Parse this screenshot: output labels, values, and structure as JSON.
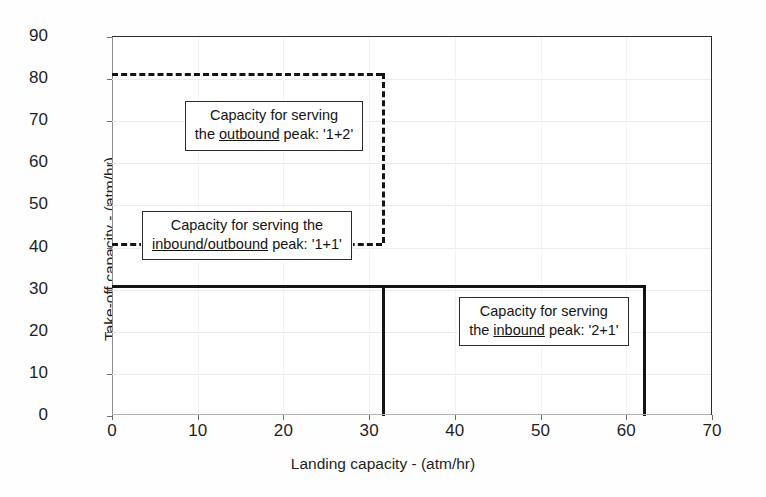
{
  "chart_data": {
    "type": "line",
    "title": "",
    "xlabel": "Landing capacity  -  (atm/hr)",
    "ylabel": "Take-off capacity  -  (atm/hr)",
    "xlim": [
      0,
      70
    ],
    "ylim": [
      0,
      90
    ],
    "xticks": [
      0,
      10,
      20,
      30,
      40,
      50,
      60,
      70
    ],
    "yticks": [
      0,
      10,
      20,
      30,
      40,
      50,
      60,
      70,
      80,
      90
    ],
    "grid": true,
    "legend": "none",
    "units": "atm/hr",
    "series": [
      {
        "name": "Capacity envelope for the outbound peak: '1+2'",
        "style": "dashed",
        "color": "#141414",
        "points": [
          [
            0,
            81.5
          ],
          [
            31.5,
            81.5
          ],
          [
            31.5,
            41.0
          ]
        ]
      },
      {
        "name": "Capacity envelope for the inbound/outbound peak: '1+1'",
        "style": "dashed",
        "color": "#141414",
        "points": [
          [
            0,
            41.0
          ],
          [
            31.5,
            41.0
          ]
        ]
      },
      {
        "name": "Capacity envelope for the inbound peak: '2+1'",
        "style": "solid",
        "color": "#141414",
        "points": [
          [
            0,
            31.0
          ],
          [
            62.0,
            31.0
          ],
          [
            62.0,
            0
          ]
        ]
      },
      {
        "name": "Vertical boundary at landing capacity 31.5",
        "style": "solid",
        "color": "#141414",
        "points": [
          [
            31.5,
            31.0
          ],
          [
            31.5,
            0
          ]
        ]
      }
    ],
    "annotations": [
      {
        "id": "outbound",
        "line1": "Capacity for serving",
        "line2_pre": "the ",
        "line2_underline": "outbound",
        "line2_post": " peak: '1+2'",
        "x": 8.5,
        "y": 74.5
      },
      {
        "id": "inbound-outbound",
        "line1": "Capacity for serving the",
        "line2_pre": "",
        "line2_underline": "inbound/outbound",
        "line2_post": " peak: '1+1'",
        "x": 3.5,
        "y": 48.5
      },
      {
        "id": "inbound",
        "line1": "Capacity for serving",
        "line2_pre": "the ",
        "line2_underline": "inbound",
        "line2_post": " peak: '2+1'",
        "x": 40.5,
        "y": 28.0
      }
    ]
  },
  "axes": {
    "x_title": "Landing capacity  -  (atm/hr)",
    "y_title": "Take-off capacity  -  (atm/hr)",
    "x_tick_labels": [
      "0",
      "10",
      "20",
      "30",
      "40",
      "50",
      "60",
      "70"
    ],
    "y_tick_labels": [
      "0",
      "10",
      "20",
      "30",
      "40",
      "50",
      "60",
      "70",
      "80",
      "90"
    ]
  },
  "colors": {
    "line": "#141414",
    "frame": "#2b2b2b",
    "grid": "#ececec",
    "background": "#ffffff",
    "text": "#1f1f1f"
  }
}
